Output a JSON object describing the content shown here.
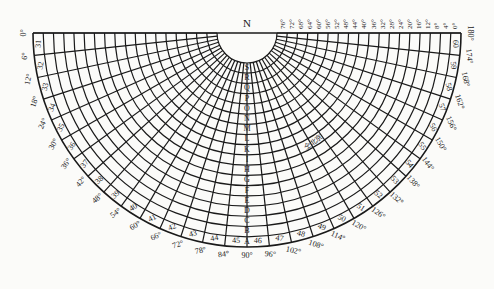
{
  "diagram": {
    "north_label": "N",
    "stamp_text": "仝北京",
    "colors": {
      "ink": "#1a1a1a",
      "paper": "#fbfbf9"
    },
    "geometry": {
      "cx": 247,
      "cy": 33,
      "r_outer": 214,
      "r_inner": 30,
      "sector_deg": 6
    },
    "ring_labels": [
      "A",
      "B",
      "C",
      "D",
      "E",
      "F",
      "G",
      "H",
      "I",
      "K",
      "L",
      "M",
      "N",
      "O",
      "P",
      "Q",
      "R",
      "S"
    ],
    "sector_numbers": [
      "31",
      "32",
      "33",
      "34",
      "35",
      "36",
      "37",
      "38",
      "39",
      "40",
      "41",
      "42",
      "43",
      "44",
      "45",
      "46",
      "47",
      "48",
      "49",
      "50",
      "51",
      "52",
      "53",
      "54",
      "55",
      "56",
      "57",
      "58",
      "59",
      "60"
    ],
    "outer_angle_labels": [
      "0°",
      "6°",
      "12°",
      "18°",
      "24°",
      "30°",
      "36°",
      "42°",
      "48°",
      "54°",
      "60°",
      "66°",
      "72°",
      "78°",
      "84°",
      "90°",
      "96°",
      "102°",
      "108°",
      "114°",
      "120°",
      "126°",
      "132°",
      "138°",
      "144°",
      "150°",
      "156°",
      "162°",
      "168°",
      "174°",
      "180°"
    ],
    "top_angle_labels": [
      "76°",
      "72°",
      "68°",
      "64°",
      "60°",
      "56°",
      "52°",
      "48°",
      "44°",
      "40°",
      "36°",
      "32°",
      "28°",
      "24°",
      "20°",
      "16°",
      "12°",
      "8°",
      "4°",
      "0°"
    ]
  }
}
